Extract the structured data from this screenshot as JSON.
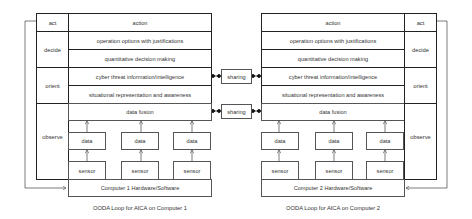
{
  "diagram": {
    "left": {
      "phases": {
        "act": "act",
        "decide": "decide",
        "orient": "orient",
        "observe": "observe"
      },
      "rows": [
        "action",
        "operation options with justifications",
        "quantitative decision making",
        "cyber threat information/intelligence",
        "situational representation and awareness",
        "data fusion"
      ],
      "data": [
        "data",
        "data",
        "data"
      ],
      "sensors": [
        "sensor",
        "sensor",
        "sensor"
      ],
      "hardware": "Computer 1 Hardware/Software",
      "caption": "OODA Loop for AICA on Computer 1"
    },
    "right": {
      "phases": {
        "act": "act",
        "decide": "decide",
        "orient": "orient",
        "observe": "observe"
      },
      "rows": [
        "action",
        "operation options with justifications",
        "quantitative decision making",
        "cyber threat information/intelligence",
        "situational representation and awareness",
        "data fusion"
      ],
      "data": [
        "data",
        "data",
        "data"
      ],
      "sensors": [
        "sensor",
        "sensor",
        "sensor"
      ],
      "hardware": "Computer 2 Hardware/Software",
      "caption": "OODA Loop for AICA on Computer 2"
    },
    "sharing": [
      "sharing",
      "sharing"
    ]
  }
}
